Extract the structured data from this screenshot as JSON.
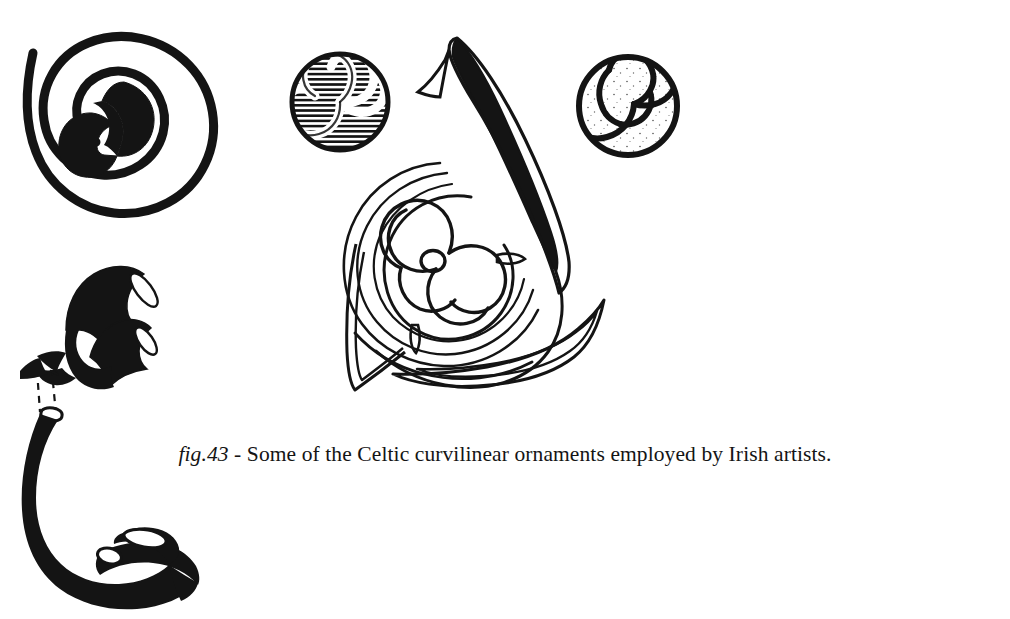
{
  "page": {
    "background_color": "#ffffff",
    "ink_color": "#111111",
    "width": 1010,
    "height": 619,
    "kind": "book-figure-plate"
  },
  "caption": {
    "figure_label": "fig.43",
    "separator": " - ",
    "text": "Some of the Celtic curvilinear ornaments employed by Irish artists.",
    "full_text": "fig.43 - Some of the Celtic curvilinear ornaments employed by Irish artists."
  },
  "ornaments": [
    {
      "id": "double-spiral",
      "name": "Double spiral (S-spiral) roundel",
      "position": "top-left",
      "fill": "solid-black-band",
      "turns": 2.5
    },
    {
      "id": "hatched-triskele-disc",
      "name": "Hatched disc with white triskele",
      "position": "top-centre-left",
      "fill": "horizontal-hatching"
    },
    {
      "id": "large-spiral-motif",
      "name": "Large spiral motif with trumpet leaves",
      "position": "centre",
      "fill": "line-outline-with-solid-leaf"
    },
    {
      "id": "outlined-triskele-disc",
      "name": "Outlined disc with triskele pinwheel",
      "position": "top-right",
      "fill": "outline"
    },
    {
      "id": "trumpet-spiral",
      "name": "Trumpet-spiral ornament with construction lines",
      "position": "bottom-left",
      "fill": "solid-black"
    }
  ]
}
